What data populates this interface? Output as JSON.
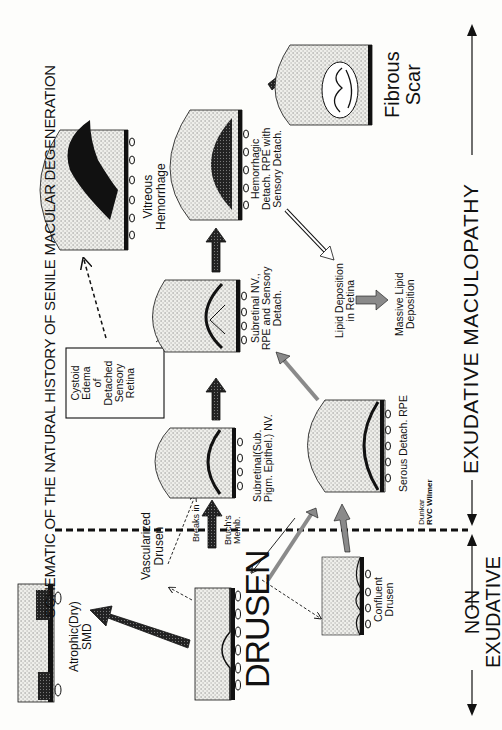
{
  "title": "SCHEMATIC OF THE NATURAL HISTORY OF SENILE MACULAR DEGENERATION",
  "stages": {
    "drusen": "DRUSEN",
    "atrophic": [
      "Atrophic(Dry)",
      "SMD"
    ],
    "vascularized_drusen": [
      "Vascularized",
      "Drusen"
    ],
    "confluent_drusen": [
      "Confluent",
      "Drusen"
    ],
    "breaks": [
      "Breaks",
      "in",
      "Bruch's",
      "Memb."
    ],
    "subretinal_nv": [
      "Subretinal(Sub.",
      "Pigm. Epithel.) NV."
    ],
    "serous_detach": "Serous Detach. RPE",
    "subretinal_nv_rpe": [
      "Subretinal NV.,",
      "RPE and Sensory",
      "Detach."
    ],
    "cystoid_edema": [
      "Cystoid",
      "Edema",
      "of",
      "Detached",
      "Sensory",
      "Retina"
    ],
    "vitreous_hemorrhage": [
      "Vitreous",
      "Hemorrhage"
    ],
    "hemorrhagic_detach": [
      "Hemorrhagic",
      "Detach. RPE with",
      "Sensory Detach."
    ],
    "lipid_deposition": [
      "Lipid Deposition",
      "in Retina"
    ],
    "massive_lipid": [
      "Massive Lipid",
      "Deposition"
    ],
    "fibrous_scar": [
      "Fibrous",
      "Scar"
    ]
  },
  "axis": {
    "non_exudative": [
      "NON",
      "EXUDATIVE"
    ],
    "exudative": "EXUDATIVE MACULOPATHY"
  },
  "credit": [
    "Dunkar",
    "RVC Wilmer"
  ],
  "colors": {
    "ink": "#111111",
    "stipple": "#d9d9d4",
    "gray_arrow": "#8a8a8a",
    "paper": "#fdfdfb"
  }
}
